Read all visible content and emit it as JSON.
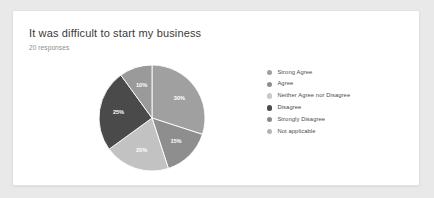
{
  "card": {
    "title": "It was difficult to start my business",
    "response_count": "20 responses"
  },
  "chart_data": {
    "type": "pie",
    "title": "It was difficult to start my business",
    "subtitle": "20 responses",
    "categories": [
      "Strong Agree",
      "Agree",
      "Neither Agree nor Disagree",
      "Disagree",
      "Strongly Disagree",
      "Not applicable"
    ],
    "values": [
      30,
      15,
      20,
      25,
      10,
      0
    ],
    "value_labels": [
      "30%",
      "15%",
      "20%",
      "25%",
      "10%",
      ""
    ],
    "colors": [
      "#a0a0a0",
      "#8e8e8e",
      "#c2c2c2",
      "#4a4a4a",
      "#9a9a9a",
      "#b5b5b5"
    ],
    "start_angle": 0,
    "direction": "clockwise",
    "legend_position": "right",
    "grid": false,
    "slices": [
      {
        "label": "Strong Agree",
        "value": 30,
        "display": "30%",
        "color": "#a0a0a0"
      },
      {
        "label": "Agree",
        "value": 15,
        "display": "15%",
        "color": "#8e8e8e"
      },
      {
        "label": "Neither Agree nor Disagree",
        "value": 20,
        "display": "20%",
        "color": "#c2c2c2"
      },
      {
        "label": "Disagree",
        "value": 25,
        "display": "25%",
        "color": "#4a4a4a"
      },
      {
        "label": "Strongly Disagree",
        "value": 10,
        "display": "10%",
        "color": "#9a9a9a"
      },
      {
        "label": "Not applicable",
        "value": 0,
        "display": "",
        "color": "#b5b5b5"
      }
    ]
  },
  "legend": {
    "items": [
      {
        "label": "Strong Agree",
        "color": "#a0a0a0"
      },
      {
        "label": "Agree",
        "color": "#8e8e8e"
      },
      {
        "label": "Neither Agree nor Disagree",
        "color": "#c9c9c9"
      },
      {
        "label": "Disagree",
        "color": "#4a4a4a"
      },
      {
        "label": "Strongly Disagree",
        "color": "#8a8a8a"
      },
      {
        "label": "Not applicable",
        "color": "#b5b5b5"
      }
    ]
  }
}
